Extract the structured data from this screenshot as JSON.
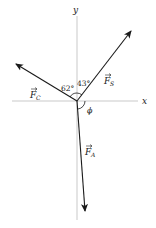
{
  "diagram": {
    "axes": {
      "x_label": "x",
      "y_label": "y"
    },
    "vectors": [
      {
        "name": "F_C",
        "label_base": "F",
        "label_sub": "C"
      },
      {
        "name": "F_S",
        "label_base": "F",
        "label_sub": "S"
      },
      {
        "name": "F_A",
        "label_base": "F",
        "label_sub": "A"
      }
    ],
    "angles": {
      "fc_to_y": "62°",
      "fs_to_y": "43°",
      "phi": "ϕ"
    },
    "colors": {
      "axis": "#bbbbbb",
      "vector": "#1a1a1a",
      "text": "#222222"
    }
  }
}
